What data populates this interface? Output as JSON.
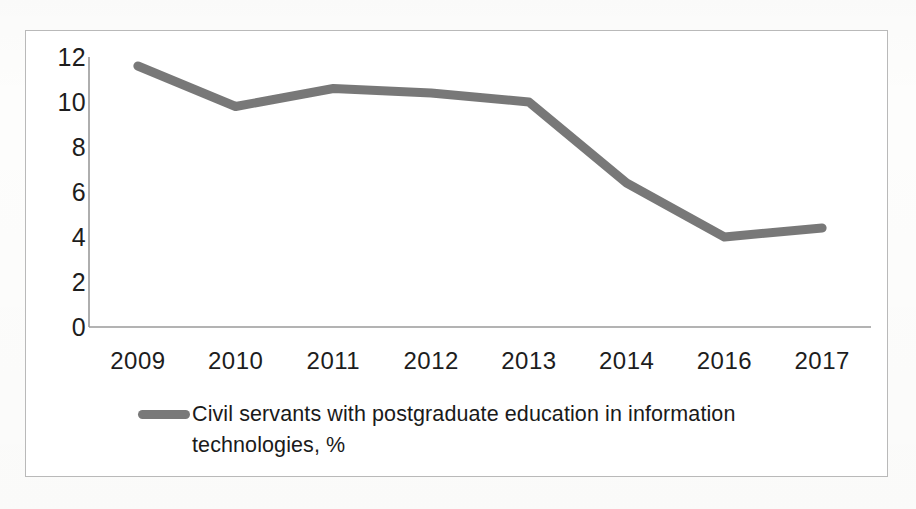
{
  "chart_data": {
    "type": "line",
    "title": "",
    "subtitle": "",
    "xlabel": "",
    "ylabel": "",
    "categories": [
      "2009",
      "2010",
      "2011",
      "2012",
      "2013",
      "2014",
      "2016",
      "2017"
    ],
    "series": [
      {
        "name": "Civil servants with postgraduate education in information technologies, %",
        "values": [
          11.6,
          9.8,
          10.6,
          10.4,
          10.0,
          6.4,
          4.0,
          4.4
        ],
        "color": "#6e6e6e"
      }
    ],
    "ylim": [
      0,
      12
    ],
    "yticks": [
      "12",
      "10",
      "8",
      "6",
      "4",
      "2",
      "0"
    ],
    "ytick_values": [
      12,
      10,
      8,
      6,
      4,
      2,
      0
    ],
    "xtick_labels": [
      "2009",
      "2010",
      "2011",
      "2012",
      "2013",
      "2014",
      "2016",
      "2017"
    ],
    "grid": false,
    "legend_position": "bottom",
    "legend_entries": [
      "Civil servants with postgraduate education in information technologies, %"
    ],
    "axis_color": "#9a9a9a",
    "text_color": "#1d1d1d",
    "frame_color": "#b9b9b9",
    "background": "#ffffff"
  },
  "legend": {
    "label": "Civil servants with postgraduate education in information technologies, %",
    "marker_color": "#6e6e6e"
  }
}
